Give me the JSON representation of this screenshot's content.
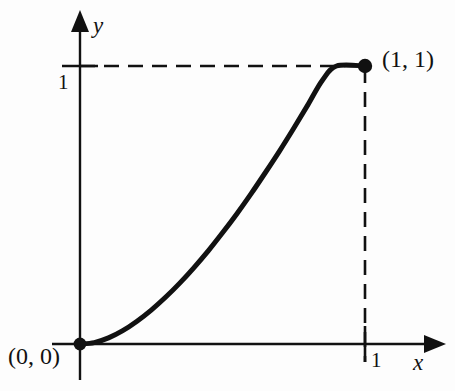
{
  "figure": {
    "background_color": "#fdfdfd",
    "ink_color": "#111111",
    "axes": {
      "x_axis_name": "x",
      "y_axis_name": "y",
      "x_tick_label": "1",
      "y_tick_label": "1"
    },
    "annotations": {
      "origin_point_label": "(0, 0)",
      "unit_point_label": "(1, 1)"
    }
  },
  "chart_data": {
    "type": "line",
    "title": "",
    "xlabel": "x",
    "ylabel": "y",
    "xlim": [
      0,
      1
    ],
    "ylim": [
      0,
      1
    ],
    "grid": false,
    "legend": "none",
    "xticks": [
      1
    ],
    "xticklabels": [
      "1"
    ],
    "yticks": [
      1
    ],
    "yticklabels": [
      "1"
    ],
    "series": [
      {
        "name": "curve",
        "style": "solid",
        "color": "#111111",
        "linewidth": 5,
        "x": [
          0.0,
          0.05,
          0.1,
          0.15,
          0.2,
          0.25,
          0.3,
          0.35,
          0.4,
          0.45,
          0.5,
          0.55,
          0.6,
          0.65,
          0.7,
          0.75,
          0.8,
          0.85,
          0.9,
          0.95,
          1.0
        ],
        "y": [
          0.0,
          0.005,
          0.022,
          0.048,
          0.082,
          0.122,
          0.168,
          0.219,
          0.275,
          0.335,
          0.4,
          0.468,
          0.54,
          0.616,
          0.694,
          0.776,
          0.861,
          0.948,
          1.0,
          1.0,
          1.0
        ]
      }
    ],
    "markers": [
      {
        "name": "origin-point",
        "x": 0,
        "y": 0,
        "label": "(0, 0)",
        "shape": "filled-circle"
      },
      {
        "name": "unit-point",
        "x": 1,
        "y": 1,
        "label": "(1, 1)",
        "shape": "filled-circle"
      }
    ],
    "guides": [
      {
        "name": "horizontal-dashed-guide",
        "from": [
          0,
          1
        ],
        "to": [
          1,
          1
        ],
        "style": "dashed"
      },
      {
        "name": "vertical-dashed-guide",
        "from": [
          1,
          1
        ],
        "to": [
          1,
          0
        ],
        "style": "dashed"
      }
    ],
    "annotations": [
      {
        "name": "origin-point-label",
        "text": "(0, 0)",
        "x": 0,
        "y": 0
      },
      {
        "name": "unit-point-label",
        "text": "(1, 1)",
        "x": 1,
        "y": 1
      }
    ]
  }
}
